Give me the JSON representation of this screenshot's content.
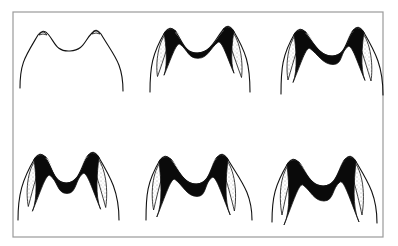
{
  "figure": {
    "frame": {
      "x": 13,
      "y": 12,
      "width": 370,
      "height": 225,
      "stroke": "#9a9a9a"
    },
    "colors": {
      "outline": "#111111",
      "dentine": "#0a0a0a",
      "stipple": "#555555",
      "background": "#ffffff"
    },
    "panels": [
      {
        "stage": 1,
        "wear": 0.0,
        "lc": [
          43,
          32
        ],
        "rc": [
          96,
          31
        ],
        "valley": [
          70,
          51
        ],
        "lb": [
          20,
          88
        ],
        "rb": [
          123,
          91
        ]
      },
      {
        "stage": 2,
        "wear": 0.25,
        "lc": [
          170,
          29
        ],
        "rc": [
          228,
          27
        ],
        "valley": [
          198,
          53
        ],
        "lb": [
          150,
          92
        ],
        "rb": [
          250,
          92
        ]
      },
      {
        "stage": 3,
        "wear": 0.5,
        "lc": [
          300,
          30
        ],
        "rc": [
          358,
          28
        ],
        "valley": [
          333,
          56
        ],
        "lb": [
          281,
          94
        ],
        "rb": [
          383,
          95
        ]
      },
      {
        "stage": 4,
        "wear": 0.65,
        "lc": [
          40,
          155
        ],
        "rc": [
          93,
          153
        ],
        "valley": [
          67,
          183
        ],
        "lb": [
          18,
          220
        ],
        "rb": [
          119,
          220
        ]
      },
      {
        "stage": 5,
        "wear": 0.8,
        "lc": [
          165,
          157
        ],
        "rc": [
          222,
          155
        ],
        "valley": [
          197,
          184
        ],
        "lb": [
          146,
          220
        ],
        "rb": [
          252,
          220
        ]
      },
      {
        "stage": 6,
        "wear": 1.0,
        "lc": [
          293,
          160
        ],
        "rc": [
          350,
          157
        ],
        "valley": [
          324,
          186
        ],
        "lb": [
          272,
          222
        ],
        "rb": [
          377,
          223
        ]
      }
    ]
  }
}
